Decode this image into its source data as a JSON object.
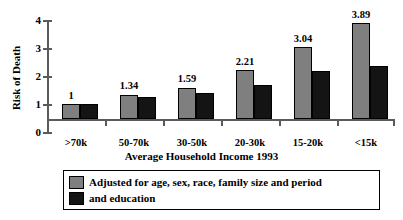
{
  "chart_data": {
    "type": "bar",
    "title": "",
    "xlabel": "Average Household Income 1993",
    "ylabel": "Risk of Death",
    "categories": [
      ">70k",
      "50-70k",
      "30-50k",
      "20-30k",
      "15-20k",
      "<15k"
    ],
    "series": [
      {
        "name": "Adjusted for age, sex, race, family size and period",
        "color": "#7f7f7f",
        "values": [
          1,
          1.34,
          1.59,
          2.21,
          3.04,
          3.89
        ],
        "labels": [
          "1",
          "1.34",
          "1.59",
          "2.21",
          "3.04",
          "3.89"
        ]
      },
      {
        "name": "and education",
        "color": "#141414",
        "values": [
          1,
          1.26,
          1.41,
          1.68,
          2.18,
          2.37
        ],
        "labels": [
          "",
          "",
          "",
          "",
          "",
          ""
        ]
      }
    ],
    "yticks": [
      0,
      1,
      2,
      3,
      4
    ],
    "ytick_labels": [
      "0",
      "1",
      "2",
      "3",
      "4"
    ],
    "ylim": [
      0,
      4
    ],
    "baseline_value": 0.45,
    "grid": false,
    "legend_position": "bottom"
  },
  "legend": {
    "entries": [
      {
        "label": "Adjusted for age, sex, race, family size and period",
        "swatch": "#7f7f7f"
      },
      {
        "label": "and education",
        "swatch": "#141414"
      }
    ]
  }
}
